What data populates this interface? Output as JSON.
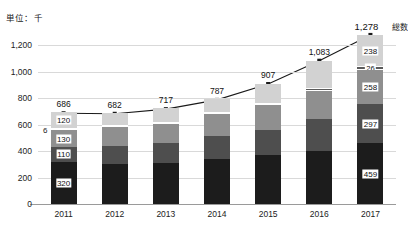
{
  "unit_caption": "単位：千",
  "series_name_total": "総数",
  "axis": {
    "y_ticks": [
      "0",
      "200",
      "400",
      "600",
      "800",
      "1,000",
      "1,200"
    ],
    "y_tick_values": [
      0,
      200,
      400,
      600,
      800,
      1000,
      1200
    ],
    "x_labels": [
      "2011",
      "2012",
      "2013",
      "2014",
      "2015",
      "2016",
      "2017"
    ]
  },
  "annotations": {
    "thin_slice_2011": "6"
  },
  "colors": {
    "segment_1": "#1c1c1c",
    "segment_2": "#4e4e4e",
    "segment_3": "#8f8f8f",
    "segment_4": "#5a5a5a",
    "segment_5": "#d2d2d2",
    "grid": "#d9d9d9",
    "axis": "#9a9a9a",
    "line": "#1a1a1a"
  },
  "chart_data": {
    "type": "bar",
    "title": "",
    "subtitle": "",
    "xlabel": "",
    "ylabel": "単位：千",
    "ylim": [
      0,
      1300
    ],
    "grid": true,
    "stacked": true,
    "legend_position": "top-right",
    "categories": [
      "2011",
      "2012",
      "2013",
      "2014",
      "2015",
      "2016",
      "2017"
    ],
    "series": [
      {
        "name": "segment-1",
        "values": [
          320,
          300,
          313,
          340,
          368,
          403,
          459
        ]
      },
      {
        "name": "segment-2",
        "values": [
          110,
          135,
          145,
          172,
          195,
          240,
          297
        ]
      },
      {
        "name": "segment-3",
        "values": [
          130,
          145,
          150,
          165,
          188,
          215,
          258
        ]
      },
      {
        "name": "segment-4",
        "values": [
          6,
          8,
          9,
          11,
          16,
          20,
          26
        ]
      },
      {
        "name": "segment-5",
        "values": [
          120,
          94,
          100,
          99,
          140,
          205,
          238
        ]
      }
    ],
    "labeled_segments": {
      "2011": [
        "320",
        "110",
        "130",
        "6",
        "120"
      ],
      "2017": [
        "459",
        "297",
        "258",
        "26",
        "238"
      ]
    },
    "total_line": {
      "name": "総数",
      "values": [
        686,
        682,
        717,
        787,
        907,
        1083,
        1278
      ],
      "labels": [
        "686",
        "682",
        "717",
        "787",
        "907",
        "1,083",
        "1,278"
      ]
    }
  }
}
